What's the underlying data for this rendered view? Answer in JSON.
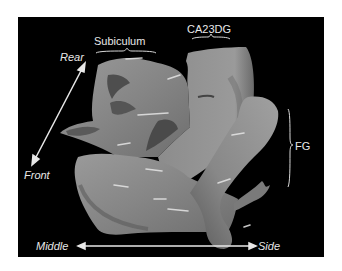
{
  "figure": {
    "background": "#000000",
    "structure_color": "#8a8a8a",
    "labels": {
      "subiculum": "Subiculum",
      "ca23dg": "CA23DG",
      "fg": "FG",
      "rear": "Rear",
      "front": "Front",
      "middle": "Middle",
      "side": "Side"
    },
    "axes": {
      "vertical": {
        "from": "Rear",
        "to": "Front"
      },
      "horizontal": {
        "from": "Middle",
        "to": "Side"
      }
    }
  }
}
